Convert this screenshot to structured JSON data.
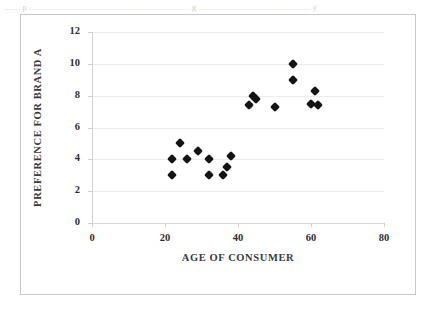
{
  "page": {
    "scan_top_text": "....... p ..................................................................... g ................................................ y"
  },
  "chart_data": {
    "type": "scatter",
    "title": "",
    "xlabel": "AGE OF CONSUMER",
    "ylabel": "PREFERENCE FOR BRAND A",
    "xlim": [
      0,
      80
    ],
    "ylim": [
      0,
      12
    ],
    "xticks": [
      0,
      20,
      40,
      60,
      80
    ],
    "yticks": [
      0,
      2,
      4,
      6,
      8,
      10,
      12
    ],
    "xtick_labels": [
      "0",
      "20",
      "40",
      "60",
      "80"
    ],
    "ytick_labels": [
      "0",
      "2",
      "4",
      "6",
      "8",
      "10",
      "12"
    ],
    "grid": "horizontal",
    "legend": "none",
    "marker": "diamond",
    "marker_color": "#141414",
    "series": [
      {
        "name": "Brand A preference",
        "points": [
          {
            "x": 22,
            "y": 4.0
          },
          {
            "x": 22,
            "y": 3.0
          },
          {
            "x": 24,
            "y": 5.0
          },
          {
            "x": 26,
            "y": 4.0
          },
          {
            "x": 29,
            "y": 4.5
          },
          {
            "x": 32,
            "y": 4.0
          },
          {
            "x": 32,
            "y": 3.0
          },
          {
            "x": 36,
            "y": 3.0
          },
          {
            "x": 37,
            "y": 3.5
          },
          {
            "x": 38,
            "y": 4.2
          },
          {
            "x": 43,
            "y": 7.4
          },
          {
            "x": 44,
            "y": 8.0
          },
          {
            "x": 45,
            "y": 7.8
          },
          {
            "x": 50,
            "y": 7.3
          },
          {
            "x": 55,
            "y": 10.0
          },
          {
            "x": 55,
            "y": 9.0
          },
          {
            "x": 61,
            "y": 8.3
          },
          {
            "x": 60,
            "y": 7.5
          },
          {
            "x": 62,
            "y": 7.4
          }
        ]
      }
    ],
    "axis_colors": {
      "grid": "#eceaea",
      "axis": "#d2d0d0",
      "text": "#2e2e2e",
      "title_text": "#3b3b3b",
      "frame": "#c8c8c8"
    }
  }
}
